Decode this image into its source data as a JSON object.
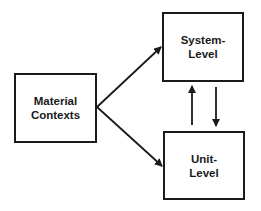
{
  "diagram": {
    "nodes": [
      {
        "id": "material-contexts",
        "label": "Material\nContexts"
      },
      {
        "id": "system-level",
        "label": "System-\nLevel"
      },
      {
        "id": "unit-level",
        "label": "Unit-\nLevel"
      }
    ],
    "edges": [
      {
        "from": "material-contexts",
        "to": "system-level"
      },
      {
        "from": "material-contexts",
        "to": "unit-level"
      },
      {
        "from": "unit-level",
        "to": "system-level"
      },
      {
        "from": "system-level",
        "to": "unit-level"
      }
    ],
    "colors": {
      "stroke": "#1a1a1a",
      "background": "#ffffff"
    }
  }
}
